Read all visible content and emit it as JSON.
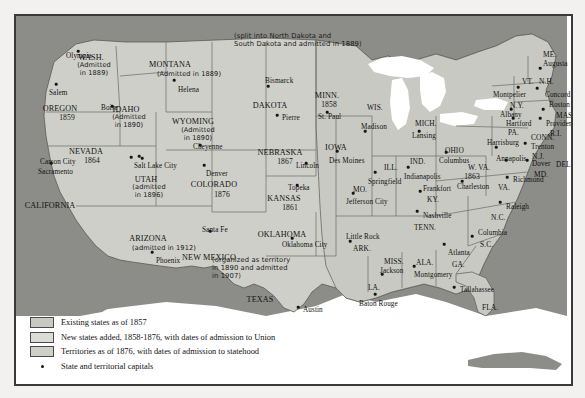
{
  "map": {
    "title_present": false,
    "colors": {
      "ocean_and_foreign": "#8c8c88",
      "existing_states": "#c9c9c4",
      "new_states": "#dcdcd7",
      "territories": "#cfcfc9",
      "lakes": "#ffffff",
      "border": "#3a3a3a"
    },
    "notes": [
      {
        "id": "dakota-note",
        "text": "(split into North Dakota and\nSouth Dakota and admitted in 1889)",
        "x": 218,
        "y": 16
      },
      {
        "id": "oklahoma-note",
        "text": "(organized as territory\nin 1890 and admitted\nin 1907)",
        "x": 196,
        "y": 240
      }
    ],
    "places": [
      {
        "id": "wash",
        "name": "WASH.",
        "x": 75,
        "y": 38,
        "cls": "state"
      },
      {
        "id": "wash-adm",
        "name": "(Admitted\nin 1889)",
        "x": 78,
        "y": 46,
        "cls": "adm"
      },
      {
        "id": "olympia",
        "name": "Olympia",
        "x": 50,
        "y": 37,
        "cls": "cap"
      },
      {
        "id": "salem",
        "name": "Salem",
        "x": 33,
        "y": 74,
        "cls": "cap"
      },
      {
        "id": "oregon",
        "name": "OREGON",
        "x": 44,
        "y": 89,
        "cls": "state"
      },
      {
        "id": "oregon-yr",
        "name": "1859",
        "x": 51,
        "y": 98,
        "cls": "year"
      },
      {
        "id": "idaho",
        "name": "IDAHO",
        "x": 110,
        "y": 90,
        "cls": "state"
      },
      {
        "id": "idaho-adm",
        "name": "(Admitted\nin 1890)",
        "x": 113,
        "y": 98,
        "cls": "adm"
      },
      {
        "id": "boise",
        "name": "Boise",
        "x": 85,
        "y": 89,
        "cls": "cap"
      },
      {
        "id": "montana",
        "name": "MONTANA",
        "x": 154,
        "y": 45,
        "cls": "state"
      },
      {
        "id": "montana-adm",
        "name": "(Admitted in 1889)",
        "x": 173,
        "y": 55,
        "cls": "adm"
      },
      {
        "id": "helena",
        "name": "Helena",
        "x": 162,
        "y": 71,
        "cls": "cap"
      },
      {
        "id": "wyoming",
        "name": "WYOMING",
        "x": 177,
        "y": 102,
        "cls": "state"
      },
      {
        "id": "wyoming-adm",
        "name": "(Admitted\nin 1890)",
        "x": 182,
        "y": 111,
        "cls": "adm"
      },
      {
        "id": "cheyenne",
        "name": "Cheyenne",
        "x": 177,
        "y": 128,
        "cls": "cap"
      },
      {
        "id": "nevada",
        "name": "NEVADA",
        "x": 70,
        "y": 132,
        "cls": "state"
      },
      {
        "id": "nevada-yr",
        "name": "1864",
        "x": 76,
        "y": 141,
        "cls": "year"
      },
      {
        "id": "carson-city",
        "name": "Carson City",
        "x": 24,
        "y": 143,
        "cls": "cap"
      },
      {
        "id": "sacramento",
        "name": "Sacramento",
        "x": 22,
        "y": 153,
        "cls": "cap"
      },
      {
        "id": "california",
        "name": "CALIFORNIA",
        "x": 34,
        "y": 186,
        "cls": "state"
      },
      {
        "id": "salt-lake",
        "name": "Salt Lake City",
        "x": 118,
        "y": 147,
        "cls": "cap"
      },
      {
        "id": "utah",
        "name": "UTAH",
        "x": 130,
        "y": 160,
        "cls": "state"
      },
      {
        "id": "utah-adm",
        "name": "(admitted\nin 1896)",
        "x": 133,
        "y": 168,
        "cls": "adm"
      },
      {
        "id": "denver",
        "name": "Denver",
        "x": 190,
        "y": 155,
        "cls": "cap"
      },
      {
        "id": "colorado",
        "name": "COLORADO",
        "x": 198,
        "y": 165,
        "cls": "state"
      },
      {
        "id": "colorado-yr",
        "name": "1876",
        "x": 206,
        "y": 175,
        "cls": "year"
      },
      {
        "id": "arizona",
        "name": "ARIZONA",
        "x": 132,
        "y": 219,
        "cls": "state"
      },
      {
        "id": "arizona-adm",
        "name": "(admitted in 1912)",
        "x": 148,
        "y": 229,
        "cls": "adm"
      },
      {
        "id": "phoenix",
        "name": "Phoenix",
        "x": 140,
        "y": 242,
        "cls": "cap"
      },
      {
        "id": "santa-fe",
        "name": "Santa Fe",
        "x": 186,
        "y": 211,
        "cls": "cap"
      },
      {
        "id": "new-mexico",
        "name": "NEW MEXICO",
        "x": 193,
        "y": 238,
        "cls": "state"
      },
      {
        "id": "dakota",
        "name": "DAKOTA",
        "x": 254,
        "y": 86,
        "cls": "state"
      },
      {
        "id": "bismarck",
        "name": "Bismarck",
        "x": 249,
        "y": 62,
        "cls": "cap"
      },
      {
        "id": "pierre",
        "name": "Pierre",
        "x": 266,
        "y": 99,
        "cls": "cap"
      },
      {
        "id": "minn",
        "name": "MINN.",
        "x": 311,
        "y": 76,
        "cls": "state"
      },
      {
        "id": "minn-yr",
        "name": "1858",
        "x": 313,
        "y": 85,
        "cls": "year"
      },
      {
        "id": "st-paul",
        "name": "St. Paul",
        "x": 302,
        "y": 98,
        "cls": "cap"
      },
      {
        "id": "wis",
        "name": "WIS.",
        "x": 351,
        "y": 88,
        "cls": "abbr"
      },
      {
        "id": "madison",
        "name": "Madison",
        "x": 345,
        "y": 108,
        "cls": "cap"
      },
      {
        "id": "nebraska",
        "name": "NEBRASKA",
        "x": 264,
        "y": 133,
        "cls": "state"
      },
      {
        "id": "nebraska-yr",
        "name": "1867",
        "x": 269,
        "y": 142,
        "cls": "year"
      },
      {
        "id": "lincoln",
        "name": "Lincoln",
        "x": 280,
        "y": 147,
        "cls": "cap"
      },
      {
        "id": "iowa",
        "name": "IOWA",
        "x": 320,
        "y": 128,
        "cls": "state"
      },
      {
        "id": "des-moines",
        "name": "Des Moines",
        "x": 313,
        "y": 142,
        "cls": "cap"
      },
      {
        "id": "topeka",
        "name": "Topeka",
        "x": 272,
        "y": 169,
        "cls": "cap"
      },
      {
        "id": "kansas",
        "name": "KANSAS",
        "x": 268,
        "y": 179,
        "cls": "state"
      },
      {
        "id": "kansas-yr",
        "name": "1861",
        "x": 274,
        "y": 188,
        "cls": "year"
      },
      {
        "id": "mo",
        "name": "MO.",
        "x": 337,
        "y": 170,
        "cls": "abbr"
      },
      {
        "id": "jefferson",
        "name": "Jefferson City",
        "x": 330,
        "y": 183,
        "cls": "cap"
      },
      {
        "id": "ill",
        "name": "ILL.",
        "x": 368,
        "y": 148,
        "cls": "abbr"
      },
      {
        "id": "springfield",
        "name": "Springfield",
        "x": 352,
        "y": 163,
        "cls": "cap"
      },
      {
        "id": "ind",
        "name": "IND.",
        "x": 394,
        "y": 142,
        "cls": "abbr"
      },
      {
        "id": "indianapolis",
        "name": "Indianapolis",
        "x": 388,
        "y": 158,
        "cls": "cap"
      },
      {
        "id": "mich",
        "name": "MICH.",
        "x": 399,
        "y": 104,
        "cls": "abbr"
      },
      {
        "id": "lansing",
        "name": "Lansing",
        "x": 396,
        "y": 117,
        "cls": "cap"
      },
      {
        "id": "ohio",
        "name": "OHIO",
        "x": 429,
        "y": 131,
        "cls": "abbr"
      },
      {
        "id": "columbus",
        "name": "Columbus",
        "x": 423,
        "y": 142,
        "cls": "cap"
      },
      {
        "id": "wva",
        "name": "W. VA.",
        "x": 452,
        "y": 148,
        "cls": "abbr"
      },
      {
        "id": "wva-yr",
        "name": "1863",
        "x": 456,
        "y": 157,
        "cls": "year"
      },
      {
        "id": "charleston",
        "name": "Charleston",
        "x": 441,
        "y": 168,
        "cls": "cap"
      },
      {
        "id": "va",
        "name": "VA.",
        "x": 482,
        "y": 168,
        "cls": "abbr"
      },
      {
        "id": "richmond",
        "name": "Richmond",
        "x": 497,
        "y": 161,
        "cls": "cap"
      },
      {
        "id": "ky",
        "name": "KY.",
        "x": 411,
        "y": 180,
        "cls": "abbr"
      },
      {
        "id": "frankfort",
        "name": "Frankfort",
        "x": 407,
        "y": 170,
        "cls": "cap"
      },
      {
        "id": "tenn",
        "name": "TENN.",
        "x": 398,
        "y": 208,
        "cls": "abbr"
      },
      {
        "id": "nashville",
        "name": "Nashville",
        "x": 407,
        "y": 197,
        "cls": "cap"
      },
      {
        "id": "oklahoma",
        "name": "OKLAHOMA",
        "x": 266,
        "y": 215,
        "cls": "state"
      },
      {
        "id": "oklahoma-city",
        "name": "Oklahoma City",
        "x": 266,
        "y": 226,
        "cls": "cap"
      },
      {
        "id": "little-rock",
        "name": "Little Rock",
        "x": 330,
        "y": 218,
        "cls": "cap"
      },
      {
        "id": "ark",
        "name": "ARK.",
        "x": 337,
        "y": 229,
        "cls": "abbr"
      },
      {
        "id": "miss",
        "name": "MISS.",
        "x": 368,
        "y": 242,
        "cls": "abbr"
      },
      {
        "id": "jackson",
        "name": "Jackson",
        "x": 364,
        "y": 252,
        "cls": "cap"
      },
      {
        "id": "ala",
        "name": "ALA.",
        "x": 400,
        "y": 243,
        "cls": "abbr"
      },
      {
        "id": "montgomery",
        "name": "Montgomery",
        "x": 398,
        "y": 256,
        "cls": "cap"
      },
      {
        "id": "ga",
        "name": "GA.",
        "x": 436,
        "y": 245,
        "cls": "abbr"
      },
      {
        "id": "atlanta",
        "name": "Atlanta",
        "x": 432,
        "y": 234,
        "cls": "cap"
      },
      {
        "id": "sc",
        "name": "S.C.",
        "x": 464,
        "y": 225,
        "cls": "abbr"
      },
      {
        "id": "columbia",
        "name": "Columbia",
        "x": 462,
        "y": 214,
        "cls": "cap"
      },
      {
        "id": "nc",
        "name": "N.C.",
        "x": 475,
        "y": 198,
        "cls": "abbr"
      },
      {
        "id": "raleigh",
        "name": "Raleigh",
        "x": 490,
        "y": 188,
        "cls": "cap"
      },
      {
        "id": "la",
        "name": "LA.",
        "x": 352,
        "y": 268,
        "cls": "abbr"
      },
      {
        "id": "baton-rouge",
        "name": "Baton Rouge",
        "x": 343,
        "y": 285,
        "cls": "cap"
      },
      {
        "id": "texas",
        "name": "TEXAS",
        "x": 244,
        "y": 280,
        "cls": "state"
      },
      {
        "id": "austin",
        "name": "Austin",
        "x": 287,
        "y": 291,
        "cls": "cap"
      },
      {
        "id": "fla",
        "name": "FLA.",
        "x": 466,
        "y": 288,
        "cls": "abbr"
      },
      {
        "id": "tallahassee",
        "name": "Tallahassee",
        "x": 444,
        "y": 271,
        "cls": "cap"
      },
      {
        "id": "me",
        "name": "ME.",
        "x": 527,
        "y": 35,
        "cls": "abbr"
      },
      {
        "id": "augusta",
        "name": "Augusta",
        "x": 527,
        "y": 45,
        "cls": "cap"
      },
      {
        "id": "vt",
        "name": "VT.",
        "x": 506,
        "y": 62,
        "cls": "abbr"
      },
      {
        "id": "nh",
        "name": "N.H.",
        "x": 523,
        "y": 62,
        "cls": "abbr"
      },
      {
        "id": "montpelier",
        "name": "Montpelier",
        "x": 477,
        "y": 76,
        "cls": "cap"
      },
      {
        "id": "concord",
        "name": "Concord",
        "x": 529,
        "y": 76,
        "cls": "cap"
      },
      {
        "id": "ny",
        "name": "N.Y.",
        "x": 494,
        "y": 86,
        "cls": "abbr"
      },
      {
        "id": "albany",
        "name": "Albany",
        "x": 484,
        "y": 96,
        "cls": "cap"
      },
      {
        "id": "boston",
        "name": "Boston",
        "x": 533,
        "y": 86,
        "cls": "cap"
      },
      {
        "id": "mass",
        "name": "MASS.",
        "x": 540,
        "y": 96,
        "cls": "abbr"
      },
      {
        "id": "hartford",
        "name": "Hartford",
        "x": 490,
        "y": 105,
        "cls": "cap"
      },
      {
        "id": "providence",
        "name": "Providence",
        "x": 530,
        "y": 105,
        "cls": "cap"
      },
      {
        "id": "ri",
        "name": "R.I.",
        "x": 534,
        "y": 114,
        "cls": "abbr"
      },
      {
        "id": "conn",
        "name": "CONN.",
        "x": 515,
        "y": 118,
        "cls": "abbr"
      },
      {
        "id": "pa",
        "name": "PA.",
        "x": 492,
        "y": 113,
        "cls": "abbr"
      },
      {
        "id": "harrisburg",
        "name": "Harrisburg",
        "x": 471,
        "y": 124,
        "cls": "cap"
      },
      {
        "id": "trenton",
        "name": "Trenton",
        "x": 515,
        "y": 128,
        "cls": "cap"
      },
      {
        "id": "nj",
        "name": "N.J.",
        "x": 516,
        "y": 137,
        "cls": "abbr"
      },
      {
        "id": "annapolis",
        "name": "Annapolis",
        "x": 480,
        "y": 140,
        "cls": "cap"
      },
      {
        "id": "dover",
        "name": "Dover",
        "x": 516,
        "y": 145,
        "cls": "cap"
      },
      {
        "id": "del",
        "name": "DEL.",
        "x": 540,
        "y": 145,
        "cls": "abbr"
      },
      {
        "id": "md",
        "name": "MD.",
        "x": 518,
        "y": 155,
        "cls": "abbr"
      }
    ],
    "capital_dots": [
      {
        "x": 62,
        "y": 35
      },
      {
        "x": 40,
        "y": 68
      },
      {
        "x": 96,
        "y": 90
      },
      {
        "x": 158,
        "y": 64
      },
      {
        "x": 184,
        "y": 129
      },
      {
        "x": 115,
        "y": 141
      },
      {
        "x": 123,
        "y": 140
      },
      {
        "x": 35,
        "y": 147
      },
      {
        "x": 126,
        "y": 142
      },
      {
        "x": 188,
        "y": 149
      },
      {
        "x": 194,
        "y": 215
      },
      {
        "x": 136,
        "y": 236
      },
      {
        "x": 252,
        "y": 70
      },
      {
        "x": 261,
        "y": 99
      },
      {
        "x": 311,
        "y": 96
      },
      {
        "x": 349,
        "y": 115
      },
      {
        "x": 290,
        "y": 147
      },
      {
        "x": 321,
        "y": 135
      },
      {
        "x": 281,
        "y": 169
      },
      {
        "x": 337,
        "y": 177
      },
      {
        "x": 359,
        "y": 156
      },
      {
        "x": 392,
        "y": 151
      },
      {
        "x": 403,
        "y": 115
      },
      {
        "x": 430,
        "y": 136
      },
      {
        "x": 446,
        "y": 165
      },
      {
        "x": 491,
        "y": 161
      },
      {
        "x": 404,
        "y": 175
      },
      {
        "x": 401,
        "y": 195
      },
      {
        "x": 276,
        "y": 222
      },
      {
        "x": 334,
        "y": 225
      },
      {
        "x": 366,
        "y": 258
      },
      {
        "x": 398,
        "y": 250
      },
      {
        "x": 428,
        "y": 228
      },
      {
        "x": 456,
        "y": 220
      },
      {
        "x": 484,
        "y": 186
      },
      {
        "x": 359,
        "y": 278
      },
      {
        "x": 282,
        "y": 291
      },
      {
        "x": 438,
        "y": 271
      },
      {
        "x": 524,
        "y": 52
      },
      {
        "x": 502,
        "y": 71
      },
      {
        "x": 521,
        "y": 72
      },
      {
        "x": 495,
        "y": 93
      },
      {
        "x": 527,
        "y": 93
      },
      {
        "x": 497,
        "y": 102
      },
      {
        "x": 524,
        "y": 102
      },
      {
        "x": 480,
        "y": 131
      },
      {
        "x": 509,
        "y": 127
      },
      {
        "x": 490,
        "y": 144
      },
      {
        "x": 511,
        "y": 144
      }
    ]
  },
  "legend": {
    "items": [
      {
        "id": "existing-states",
        "swatch": "sw-a",
        "label": "Existing states as of 1857"
      },
      {
        "id": "new-states",
        "swatch": "sw-b",
        "label": "New states added, 1858-1876, with dates of admission to Union"
      },
      {
        "id": "territories",
        "swatch": "sw-c",
        "label": "Territories as of 1876, with dates of admission to statehood"
      }
    ],
    "capitals_label": "State and territorial capitals"
  }
}
